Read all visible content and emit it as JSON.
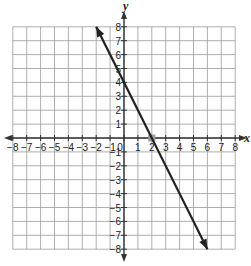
{
  "chart_data": {
    "type": "line",
    "title": "",
    "xlabel": "x",
    "ylabel": "y",
    "xlim": [
      -8,
      8
    ],
    "ylim": [
      -8,
      8
    ],
    "grid": true,
    "legend": null,
    "x_ticks": [
      -8,
      -7,
      -6,
      -5,
      -4,
      -3,
      -2,
      -1,
      0,
      1,
      2,
      3,
      4,
      5,
      6,
      7,
      8
    ],
    "y_ticks": [
      -8,
      -7,
      -6,
      -5,
      -4,
      -3,
      -2,
      -1,
      1,
      2,
      3,
      4,
      5,
      6,
      7,
      8
    ],
    "x_tick_labels": [
      "−8",
      "−7",
      "−6",
      "−5",
      "−4",
      "−3",
      "−2",
      "−1",
      "0",
      "1",
      "2",
      "3",
      "4",
      "5",
      "6",
      "7",
      "8"
    ],
    "y_tick_labels": [
      "−8",
      "−7",
      "−6",
      "−5",
      "−4",
      "−3",
      "−2",
      "−1",
      "1",
      "2",
      "3",
      "4",
      "5",
      "6",
      "7",
      "8"
    ],
    "series": [
      {
        "name": "line",
        "equation": "y = -2x + 4",
        "x": [
          -2,
          6
        ],
        "y": [
          8,
          -8
        ],
        "arrows_both_ends": true,
        "color": "#222222"
      }
    ],
    "annotations": [
      {
        "type": "point",
        "x": 2,
        "y": 0,
        "label": "x-intercept",
        "color": "#999999"
      }
    ]
  },
  "colors": {
    "grid": "#9a9a9a",
    "axis": "#333333",
    "line": "#222222",
    "intercept_marker": "#9e9e9e"
  }
}
